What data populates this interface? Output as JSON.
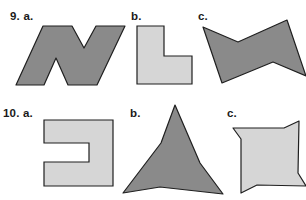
{
  "colors": {
    "dark_fill": "#8a8a8a",
    "light_fill": "#d6d6d6",
    "stroke": "#1f1f1f",
    "text": "#1a1a1a"
  },
  "problems": [
    {
      "number": "9.",
      "items": [
        {
          "letter": "a.",
          "label": "9. a.",
          "shape": "N-shaped polygon",
          "fill": "dark"
        },
        {
          "letter": "b.",
          "label": "b.",
          "shape": "L-shaped polygon",
          "fill": "light"
        },
        {
          "letter": "c.",
          "label": "c.",
          "shape": "bowtie-shaped concave polygon",
          "fill": "dark"
        }
      ]
    },
    {
      "number": "10.",
      "items": [
        {
          "letter": "a.",
          "label": "10. a.",
          "shape": "C-shaped polygon",
          "fill": "light"
        },
        {
          "letter": "b.",
          "label": "b.",
          "shape": "three-pointed concave star",
          "fill": "dark"
        },
        {
          "letter": "c.",
          "label": "c.",
          "shape": "pinwheel-like square polygon",
          "fill": "light"
        }
      ]
    }
  ]
}
